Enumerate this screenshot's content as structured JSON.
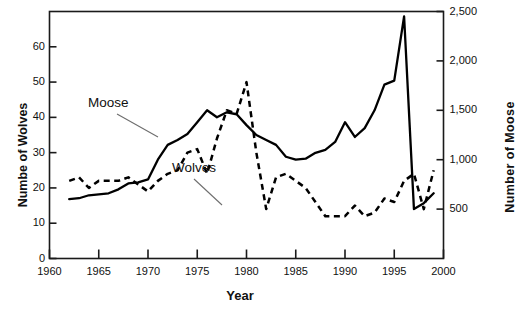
{
  "chart_data": {
    "type": "line",
    "title": "",
    "xlabel": "Year",
    "ylabel_left": "Numbe of Wolves",
    "ylabel_right": "Number  of Moose",
    "xlim": [
      1960,
      2000
    ],
    "ylim_left": [
      0,
      70
    ],
    "ylim_right": [
      0,
      2500
    ],
    "grid": false,
    "legend": "inline-annotations",
    "x_ticks": [
      1960,
      1965,
      1970,
      1975,
      1980,
      1985,
      1990,
      1995,
      2000
    ],
    "x_tick_labels": [
      "1960",
      "1965",
      "1970",
      "1975",
      "1980",
      "1985",
      "1990",
      "1995",
      "2000"
    ],
    "y_ticks_left": [
      0,
      10,
      20,
      30,
      40,
      50,
      60
    ],
    "y_tick_labels_left": [
      "0",
      "10",
      "20",
      "30",
      "40",
      "50",
      "60"
    ],
    "y_ticks_right": [
      500,
      1000,
      1500,
      2000,
      2500
    ],
    "y_tick_labels_right": [
      "500",
      "1,000",
      "1,500",
      "2,000",
      "2,500"
    ],
    "annotations": [
      {
        "text": "Moose",
        "x_px": 88,
        "y_px": 95,
        "leader_to_x_px": 158,
        "leader_to_y_px": 137
      },
      {
        "text": "Wolves",
        "x_px": 172,
        "y_px": 160,
        "leader_to_x_px": 222,
        "leader_to_y_px": 205
      }
    ],
    "series": [
      {
        "name": "Moose",
        "axis": "right",
        "style": "solid",
        "color": "#000000",
        "x": [
          1962,
          1963,
          1964,
          1965,
          1966,
          1967,
          1968,
          1969,
          1970,
          1971,
          1972,
          1973,
          1974,
          1975,
          1976,
          1977,
          1978,
          1979,
          1980,
          1981,
          1982,
          1983,
          1984,
          1985,
          1986,
          1987,
          1988,
          1989,
          1990,
          1991,
          1992,
          1993,
          1994,
          1995,
          1996,
          1997,
          1998,
          1999
        ],
        "values": [
          600,
          610,
          640,
          650,
          660,
          700,
          760,
          770,
          800,
          1000,
          1150,
          1200,
          1260,
          1380,
          1500,
          1430,
          1480,
          1460,
          1350,
          1250,
          1200,
          1150,
          1030,
          1000,
          1010,
          1070,
          1100,
          1180,
          1380,
          1230,
          1320,
          1500,
          1760,
          1800,
          2450,
          500,
          560,
          660
        ]
      },
      {
        "name": "Wolves",
        "axis": "left",
        "style": "dashed",
        "color": "#000000",
        "x": [
          1962,
          1963,
          1964,
          1965,
          1966,
          1967,
          1968,
          1969,
          1970,
          1971,
          1972,
          1973,
          1974,
          1975,
          1976,
          1977,
          1978,
          1979,
          1980,
          1981,
          1982,
          1983,
          1984,
          1985,
          1986,
          1987,
          1988,
          1989,
          1990,
          1991,
          1992,
          1993,
          1994,
          1995,
          1996,
          1997,
          1998,
          1999
        ],
        "values": [
          22,
          23,
          20,
          22,
          22,
          22,
          23,
          21,
          19,
          22,
          24,
          25,
          30,
          31,
          24,
          34,
          42,
          41,
          50,
          30,
          14,
          23,
          24,
          22,
          20,
          16,
          12,
          12,
          12,
          15,
          12,
          13,
          17,
          16,
          22,
          24,
          14,
          25
        ]
      }
    ]
  },
  "axes": {
    "left_title": "Numbe of Wolves",
    "right_title": "Number  of Moose",
    "x_title": "Year"
  }
}
